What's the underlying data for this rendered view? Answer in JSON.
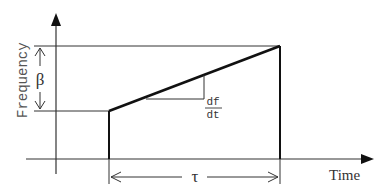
{
  "diagram": {
    "y_axis_label": "Frequency",
    "x_axis_label": "Time",
    "bandwidth_symbol": "β",
    "duration_symbol": "τ",
    "slope_label_numerator": "df",
    "slope_label_denominator": "dt",
    "colors": {
      "line": "#111111",
      "thin_line": "#333333",
      "text": "#333333",
      "background": "#ffffff"
    }
  }
}
